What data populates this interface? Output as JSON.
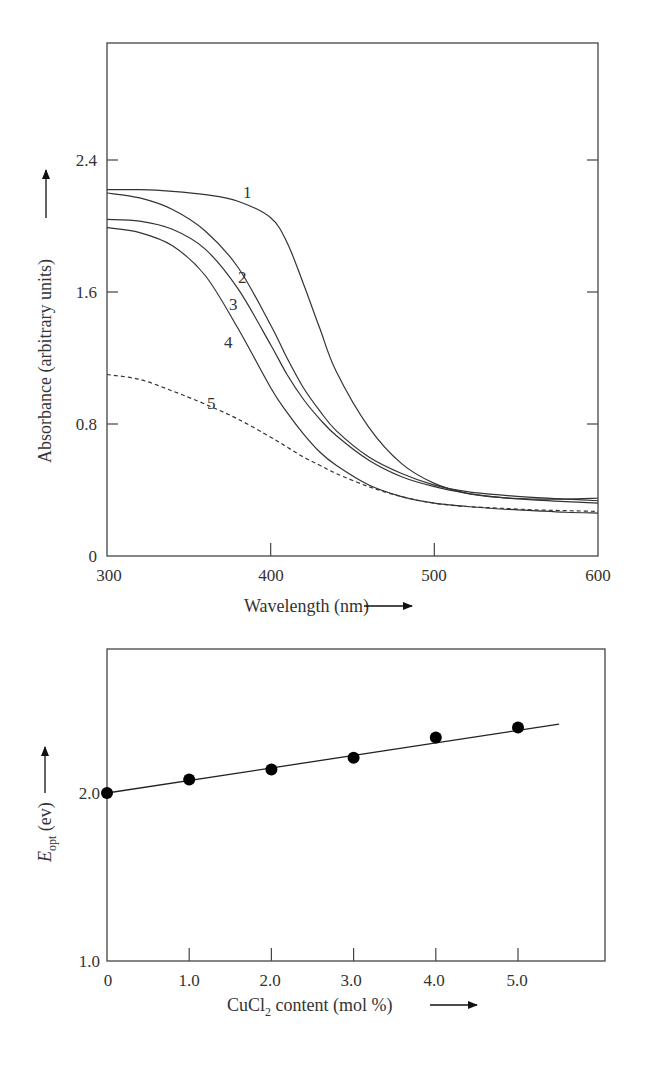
{
  "chart_data": [
    {
      "type": "line",
      "title": "",
      "xlabel": "Wavelength (nm)",
      "ylabel": "Absorbance (arbitrary units)",
      "xlim": [
        300,
        600
      ],
      "ylim": [
        0,
        3.2
      ],
      "x_ticks": [
        "300",
        "400",
        "500",
        "600"
      ],
      "y_ticks": [
        "0",
        "0.8",
        "1.6",
        "2.4"
      ],
      "grid": false,
      "legend": "inline curve labels 1-5",
      "x": [
        300,
        320,
        340,
        360,
        380,
        400,
        410,
        420,
        430,
        440,
        460,
        480,
        500,
        520,
        540,
        560,
        580,
        600
      ],
      "series": [
        {
          "name": "1",
          "style": "solid",
          "values": [
            2.22,
            2.22,
            2.21,
            2.19,
            2.15,
            2.05,
            1.9,
            1.65,
            1.38,
            1.12,
            0.78,
            0.56,
            0.44,
            0.38,
            0.355,
            0.345,
            0.345,
            0.35
          ]
        },
        {
          "name": "2",
          "style": "solid",
          "values": [
            2.2,
            2.17,
            2.1,
            1.97,
            1.75,
            1.4,
            1.2,
            1.02,
            0.88,
            0.76,
            0.6,
            0.5,
            0.43,
            0.39,
            0.37,
            0.355,
            0.345,
            0.335
          ]
        },
        {
          "name": "3",
          "style": "solid",
          "values": [
            2.04,
            2.03,
            1.98,
            1.86,
            1.62,
            1.28,
            1.1,
            0.95,
            0.83,
            0.73,
            0.58,
            0.48,
            0.42,
            0.38,
            0.355,
            0.34,
            0.33,
            0.32
          ]
        },
        {
          "name": "4",
          "style": "solid",
          "values": [
            1.99,
            1.96,
            1.88,
            1.7,
            1.38,
            1.02,
            0.87,
            0.74,
            0.63,
            0.55,
            0.43,
            0.36,
            0.32,
            0.3,
            0.285,
            0.275,
            0.265,
            0.26
          ]
        },
        {
          "name": "5",
          "style": "dashed",
          "values": [
            1.1,
            1.07,
            1.0,
            0.92,
            0.83,
            0.72,
            0.66,
            0.6,
            0.55,
            0.5,
            0.42,
            0.36,
            0.32,
            0.3,
            0.29,
            0.28,
            0.275,
            0.27
          ]
        }
      ]
    },
    {
      "type": "scatter",
      "title": "",
      "xlabel": "CuCl2 content (mol %)",
      "ylabel": "E_opt (ev)",
      "xlim": [
        0,
        6
      ],
      "ylim": [
        1.0,
        2.9
      ],
      "x_ticks": [
        "0",
        "1.0",
        "2.0",
        "3.0",
        "4.0",
        "5.0"
      ],
      "y_ticks": [
        "1.0",
        "2.0"
      ],
      "grid": false,
      "x": [
        0,
        1.0,
        2.0,
        3.0,
        4.0,
        5.0
      ],
      "series": [
        {
          "name": "E_opt",
          "marker": "filled-circle",
          "values": [
            2.0,
            2.08,
            2.14,
            2.21,
            2.33,
            2.39
          ]
        }
      ],
      "fit_line": {
        "x": [
          0,
          5.5
        ],
        "y": [
          2.0,
          2.41
        ]
      }
    }
  ],
  "top_chart": {
    "y_tick_labels": [
      "2.4",
      "1.6",
      "0.8",
      "0"
    ],
    "x_tick_labels": [
      "300",
      "400",
      "500",
      "600"
    ],
    "x_axis_title": "Wavelength (nm)",
    "y_axis_title": "Absorbance (arbitrary units)",
    "curve_labels": [
      "1",
      "2",
      "3",
      "4",
      "5"
    ]
  },
  "bottom_chart": {
    "y_tick_labels": [
      "2.0",
      "1.0"
    ],
    "x_tick_labels": [
      "0",
      "1.0",
      "2.0",
      "3.0",
      "4.0",
      "5.0"
    ],
    "x_axis_title_main": "CuCl",
    "x_axis_title_sub": "2",
    "x_axis_title_rest": " content (mol %)",
    "y_axis_title_main": "E",
    "y_axis_title_sub": "opt",
    "y_axis_title_rest": " (ev)"
  }
}
